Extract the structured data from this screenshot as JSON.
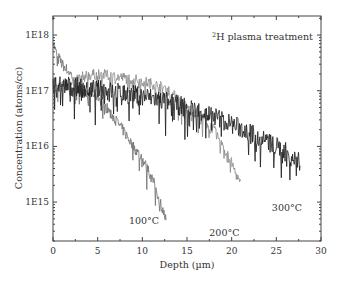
{
  "chart_data": {
    "type": "line",
    "title_parts": {
      "superscript": "2",
      "text": "H plasma treatment"
    },
    "xlabel": "Depth (µm)",
    "ylabel": "Concentration (atoms/cc)",
    "xlim": [
      0,
      30
    ],
    "ylim": [
      200000000000000.0,
      2.2e+18
    ],
    "yscale": "log",
    "xticks": [
      0,
      5,
      10,
      15,
      20,
      25,
      30
    ],
    "xtick_labels": [
      "0",
      "5",
      "10",
      "15",
      "20",
      "25",
      "30"
    ],
    "yticks": [
      1000000000000000.0,
      1e+16,
      1e+17,
      1e+18
    ],
    "ytick_labels": [
      "1E15",
      "1E16",
      "1E17",
      "1E18"
    ],
    "grid": false,
    "legend": "none (inline annotations)",
    "series": [
      {
        "name": "100°C",
        "color": "#6e6e6e",
        "x": [
          0,
          0.3,
          1,
          2,
          3,
          4,
          5,
          6,
          7,
          8,
          9,
          10,
          11,
          12,
          12.7
        ],
        "values": [
          8e+17,
          5e+17,
          3e+17,
          2e+17,
          1.1e+17,
          9e+16,
          8e+16,
          5e+16,
          3e+16,
          1.8e+16,
          1e+16,
          6000000000000000.0,
          3000000000000000.0,
          1000000000000000.0,
          450000000000000.0
        ]
      },
      {
        "name": "200°C",
        "color": "#8a8a8a",
        "x": [
          0,
          1,
          2,
          3,
          4,
          5,
          6,
          7,
          8,
          9,
          10,
          11,
          12,
          13,
          14,
          15,
          16,
          17,
          18,
          19,
          20,
          21
        ],
        "values": [
          1e+17,
          1.3e+17,
          1.5e+17,
          1.7e+17,
          1.9e+17,
          2e+17,
          1.9e+17,
          1.8e+17,
          1.7e+17,
          1.6e+17,
          1.5e+17,
          1.35e+17,
          1.2e+17,
          1e+17,
          7e+16,
          5e+16,
          4e+16,
          3e+16,
          2e+16,
          1e+16,
          5000000000000000.0,
          2000000000000000.0
        ]
      },
      {
        "name": "300°C",
        "color": "#1a1a1a",
        "x": [
          0,
          2,
          4,
          6,
          8,
          10,
          12,
          14,
          16,
          18,
          20,
          22,
          24,
          25,
          26,
          27,
          27.7
        ],
        "values": [
          1.3e+17,
          1.2e+17,
          1.1e+17,
          1e+17,
          9e+16,
          8e+16,
          7e+16,
          5.5e+16,
          4.5e+16,
          3.5e+16,
          2.5e+16,
          1.8e+16,
          1.2e+16,
          1e+16,
          8000000000000000.0,
          6000000000000000.0,
          5000000000000000.0
        ]
      }
    ],
    "annotations": [
      {
        "text": "100°C",
        "x": 8.5,
        "y": 400000000000000.0
      },
      {
        "text": "200°C",
        "x": 17.5,
        "y": 250000000000000.0
      },
      {
        "text": "300°C",
        "x": 24.5,
        "y": 700000000000000.0
      }
    ]
  }
}
